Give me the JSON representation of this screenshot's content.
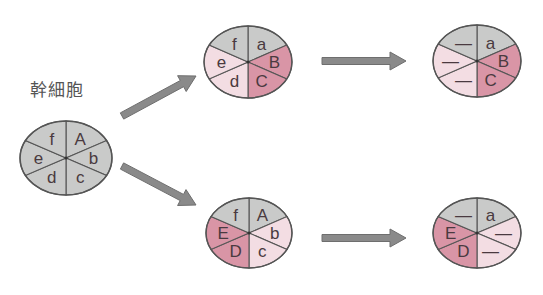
{
  "diagram": {
    "title_label": "幹細胞",
    "colors": {
      "gray": "#c9cac9",
      "light_pink": "#f3dde3",
      "dark_pink": "#d995a6",
      "outline": "#555555",
      "arrow": "#8a8a8a"
    },
    "cells": [
      {
        "id": "stem-cell",
        "name": "幹細胞",
        "cx": 66,
        "cy": 158,
        "rx": 46,
        "ry": 37,
        "segments": [
          {
            "label": "A",
            "fill": "gray"
          },
          {
            "label": "b",
            "fill": "gray"
          },
          {
            "label": "c",
            "fill": "gray"
          },
          {
            "label": "d",
            "fill": "gray"
          },
          {
            "label": "e",
            "fill": "gray"
          },
          {
            "label": "f",
            "fill": "gray"
          }
        ]
      },
      {
        "id": "upper-daughter",
        "cx": 248,
        "cy": 62,
        "rx": 44,
        "ry": 36,
        "segments": [
          {
            "label": "a",
            "fill": "gray"
          },
          {
            "label": "B",
            "fill": "dark_pink"
          },
          {
            "label": "C",
            "fill": "dark_pink"
          },
          {
            "label": "d",
            "fill": "light_pink"
          },
          {
            "label": "e",
            "fill": "light_pink"
          },
          {
            "label": "f",
            "fill": "gray"
          }
        ]
      },
      {
        "id": "upper-differentiated",
        "cx": 477,
        "cy": 61,
        "rx": 44,
        "ry": 36,
        "segments": [
          {
            "label": "a",
            "fill": "gray"
          },
          {
            "label": "B",
            "fill": "dark_pink"
          },
          {
            "label": "C",
            "fill": "dark_pink"
          },
          {
            "label": "—",
            "fill": "light_pink"
          },
          {
            "label": "—",
            "fill": "light_pink"
          },
          {
            "label": "—",
            "fill": "gray"
          }
        ]
      },
      {
        "id": "lower-daughter",
        "cx": 249,
        "cy": 233,
        "rx": 43,
        "ry": 35,
        "segments": [
          {
            "label": "A",
            "fill": "gray"
          },
          {
            "label": "b",
            "fill": "light_pink"
          },
          {
            "label": "c",
            "fill": "light_pink"
          },
          {
            "label": "D",
            "fill": "dark_pink"
          },
          {
            "label": "E",
            "fill": "dark_pink"
          },
          {
            "label": "f",
            "fill": "gray"
          }
        ]
      },
      {
        "id": "lower-differentiated",
        "cx": 477,
        "cy": 233,
        "rx": 44,
        "ry": 35,
        "segments": [
          {
            "label": "a",
            "fill": "gray"
          },
          {
            "label": "—",
            "fill": "light_pink"
          },
          {
            "label": "—",
            "fill": "light_pink"
          },
          {
            "label": "D",
            "fill": "dark_pink"
          },
          {
            "label": "E",
            "fill": "dark_pink"
          },
          {
            "label": "—",
            "fill": "gray"
          }
        ]
      }
    ],
    "arrows": [
      {
        "id": "arrow-stem-to-upper",
        "from": [
          122,
          116
        ],
        "to": [
          196,
          76
        ]
      },
      {
        "id": "arrow-stem-to-lower",
        "from": [
          122,
          166
        ],
        "to": [
          196,
          205
        ]
      },
      {
        "id": "arrow-upper-to-right",
        "from": [
          322,
          61
        ],
        "to": [
          406,
          61
        ]
      },
      {
        "id": "arrow-lower-to-right",
        "from": [
          322,
          238
        ],
        "to": [
          406,
          238
        ]
      }
    ]
  }
}
